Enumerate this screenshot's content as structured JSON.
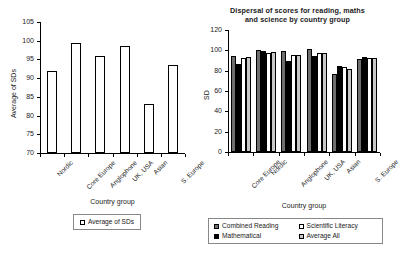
{
  "figure": {
    "background": "#ffffff"
  },
  "chart_data": [
    {
      "type": "bar",
      "id": "left",
      "title": "",
      "xlabel": "Country group",
      "ylabel": "Average of SDs",
      "categories": [
        "Nordic",
        "Core Europe",
        "Anglophone",
        "UK, USA",
        "Asian",
        "S. Europe"
      ],
      "values": [
        92.0,
        99.5,
        95.8,
        98.5,
        83.0,
        93.6
      ],
      "ylim": [
        70,
        105
      ],
      "yticks": [
        70,
        75,
        80,
        85,
        90,
        95,
        100,
        105
      ],
      "grid": false,
      "legend_position": "bottom",
      "series": [
        {
          "name": "Average of SDs",
          "color": "#ffffff"
        }
      ]
    },
    {
      "type": "bar",
      "id": "right",
      "title": "Dispersal of scores for reading, maths and science by country group",
      "title_line1": "Dispersal of scores for reading, maths",
      "title_line2": "and science by country group",
      "xlabel": "Country group",
      "ylabel": "SD",
      "categories": [
        "Core Europe",
        "Nordic",
        "Anglophone",
        "UK, USA",
        "Asian",
        "S. Europe"
      ],
      "ylim": [
        0,
        120
      ],
      "yticks": [
        0,
        20,
        40,
        60,
        80,
        100,
        120
      ],
      "grid": false,
      "legend_position": "bottom",
      "series": [
        {
          "name": "Combined Reading",
          "color": "#6e6e6e",
          "values": [
            94,
            100,
            99,
            101,
            77,
            91
          ]
        },
        {
          "name": "Mathematical",
          "color": "#000000",
          "values": [
            87,
            99,
            90,
            94,
            85,
            93
          ]
        },
        {
          "name": "Scientific Literacy",
          "color": "#ffffff",
          "values": [
            92,
            97,
            95,
            97,
            84,
            92
          ]
        },
        {
          "name": "Average All",
          "color": "#c8c8c8",
          "values": [
            93,
            98,
            95,
            97,
            82,
            92
          ]
        }
      ]
    }
  ]
}
